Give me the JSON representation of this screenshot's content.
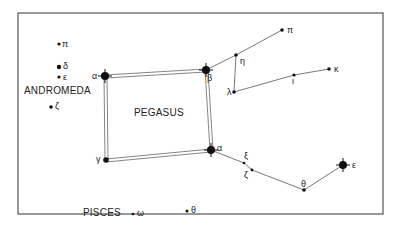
{
  "constellations": {
    "andromeda": "ANDROMEDA",
    "pegasus": "PEGASUS",
    "pisces": "PISCES"
  },
  "stars": [
    {
      "id": "and-alpha",
      "label": "α",
      "x": 105,
      "y": 76,
      "mag": "bright"
    },
    {
      "id": "peg-beta",
      "label": "β",
      "x": 206,
      "y": 70,
      "mag": "bright"
    },
    {
      "id": "peg-alpha",
      "label": "α",
      "x": 211,
      "y": 150,
      "mag": "bright"
    },
    {
      "id": "peg-gamma",
      "label": "γ",
      "x": 106,
      "y": 160,
      "mag": "medium"
    },
    {
      "id": "peg-eta",
      "label": "η",
      "x": 236,
      "y": 55,
      "mag": "small"
    },
    {
      "id": "peg-pi",
      "label": "π",
      "x": 282,
      "y": 30,
      "mag": "small"
    },
    {
      "id": "peg-lambda",
      "label": "λ",
      "x": 234,
      "y": 92,
      "mag": "small"
    },
    {
      "id": "peg-iota",
      "label": "ι",
      "x": 294,
      "y": 75,
      "mag": "small"
    },
    {
      "id": "peg-kappa",
      "label": "κ",
      "x": 329,
      "y": 69,
      "mag": "small"
    },
    {
      "id": "peg-xi",
      "label": "ξ",
      "x": 244,
      "y": 163,
      "mag": "tiny"
    },
    {
      "id": "peg-zeta",
      "label": "ζ",
      "x": 252,
      "y": 170,
      "mag": "tiny"
    },
    {
      "id": "peg-theta",
      "label": "θ",
      "x": 304,
      "y": 190,
      "mag": "small"
    },
    {
      "id": "peg-epsilon",
      "label": "ε",
      "x": 343,
      "y": 165,
      "mag": "bright"
    },
    {
      "id": "and-pi",
      "label": "π",
      "x": 58,
      "y": 44,
      "mag": "small"
    },
    {
      "id": "and-delta",
      "label": "δ",
      "x": 58,
      "y": 67,
      "mag": "medium"
    },
    {
      "id": "and-epsilon",
      "label": "ε",
      "x": 59,
      "y": 77,
      "mag": "small"
    },
    {
      "id": "and-zeta",
      "label": "ζ",
      "x": 50,
      "y": 107,
      "mag": "small"
    },
    {
      "id": "psc-omega",
      "label": "ω",
      "x": 131,
      "y": 213,
      "mag": "tiny"
    },
    {
      "id": "psc-theta",
      "label": "θ",
      "x": 187,
      "y": 211,
      "mag": "small"
    }
  ]
}
